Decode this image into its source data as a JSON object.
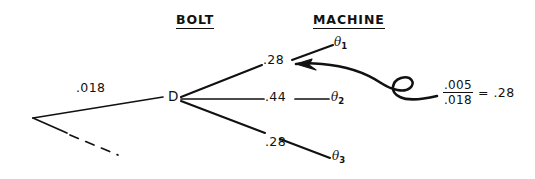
{
  "diagram": {
    "headers": [
      {
        "label": "BOLT"
      },
      {
        "label": "MACHINE"
      }
    ],
    "node": {
      "label": "D"
    },
    "input_branch": {
      "value": ".018"
    },
    "branches": [
      {
        "value": ".28",
        "outcome": "θ",
        "subscript": "1"
      },
      {
        "value": ".44",
        "outcome": "θ",
        "subscript": "2"
      },
      {
        "value": ".28",
        "outcome": "θ",
        "subscript": "3"
      }
    ],
    "callout": {
      "numerator": ".005",
      "denominator": ".018",
      "equals": "=",
      "result": ".28"
    },
    "colors": {
      "ink": "#111111",
      "paper": "#ffffff"
    }
  }
}
